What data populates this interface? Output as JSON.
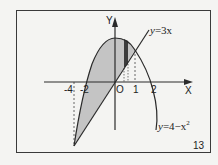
{
  "figure": {
    "number": "13",
    "axis_labels": {
      "x": "X",
      "y": "Y",
      "origin": "O"
    },
    "x_ticks": [
      "-4",
      "-2",
      "1",
      "2"
    ],
    "curves": [
      {
        "name": "line",
        "equation": "y=3x",
        "eq_lhs": "y",
        "eq_rhs": "=3x"
      },
      {
        "name": "parabola",
        "equation": "y=4−x²",
        "eq_lhs": "y",
        "eq_rhs": "=4−x",
        "eq_sup": "2"
      }
    ],
    "shaded_region": "between y=4−x² and y=3x for −4 ≤ x ≤ 1",
    "strip": "dark vertical strip between x≈0.3 and x≈0.55",
    "colors": {
      "fill": "#c4c4c4",
      "strip": "#3c3c3c",
      "stroke": "#2a2a2a",
      "background": "#f4f4f2"
    }
  }
}
